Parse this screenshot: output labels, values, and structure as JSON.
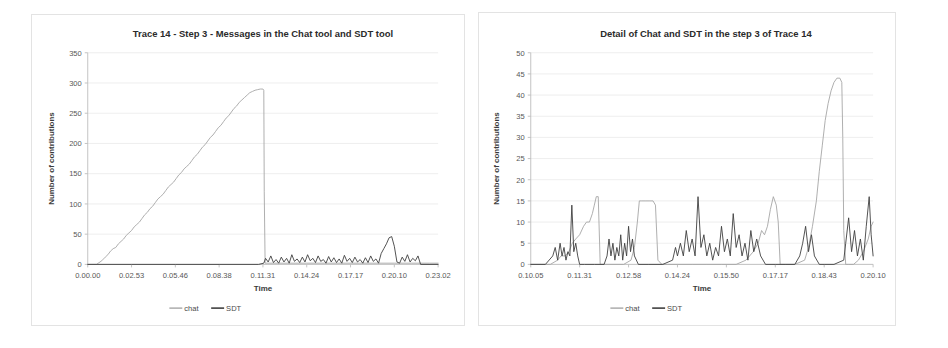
{
  "figure": {
    "background": "#ffffff",
    "panel_border_color": "#e3e3e3"
  },
  "colors": {
    "chat": "#a6a6a6",
    "sdt": "#3f3f3f",
    "grid": "#e9e9e9",
    "axis": "#bdbdbd",
    "text": "#404040"
  },
  "legend": {
    "chat_label": "chat",
    "sdt_label": "SDT"
  },
  "chart_data": [
    {
      "id": "left",
      "type": "line",
      "title": "Trace 14 - Step 3 - Messages in the Chat tool and SDT tool",
      "xlabel": "Time",
      "ylabel": "Number of contributions",
      "grid": true,
      "legend_position": "bottom",
      "ylim": [
        0,
        350
      ],
      "yticks": [
        0,
        50,
        100,
        150,
        200,
        250,
        300,
        350
      ],
      "ytick_labels": [
        "0",
        "50",
        "100",
        "150",
        "200",
        "250",
        "300",
        "350"
      ],
      "xlim": [
        0,
        8
      ],
      "xticks": [
        0,
        1,
        2,
        3,
        4,
        5,
        6,
        7,
        8
      ],
      "xtick_labels": [
        "0.00.00",
        "0.02.53",
        "0.05.46",
        "0.08.38",
        "0.11.31",
        "0.14.24",
        "0.17.17",
        "0.20.10",
        "0.23.02"
      ],
      "series": [
        {
          "name": "chat",
          "color": "#a6a6a6",
          "x": [
            0.0,
            0.2,
            0.32,
            0.4,
            0.46,
            0.52,
            0.58,
            0.64,
            0.7,
            0.76,
            0.82,
            0.88,
            0.94,
            1.0,
            1.06,
            1.12,
            1.18,
            1.24,
            1.3,
            1.36,
            1.42,
            1.48,
            1.54,
            1.6,
            1.66,
            1.72,
            1.78,
            1.84,
            1.9,
            1.96,
            2.02,
            2.08,
            2.14,
            2.2,
            2.26,
            2.32,
            2.38,
            2.44,
            2.5,
            2.56,
            2.62,
            2.68,
            2.74,
            2.8,
            2.86,
            2.92,
            2.98,
            3.04,
            3.1,
            3.16,
            3.22,
            3.28,
            3.34,
            3.4,
            3.46,
            3.52,
            3.58,
            3.64,
            3.7,
            3.76,
            3.82,
            3.88,
            3.94,
            4.0,
            4.02,
            4.03,
            4.05,
            4.3,
            4.6,
            5.0,
            5.4,
            5.8,
            6.2,
            6.6,
            7.0,
            7.4,
            7.8,
            8.0
          ],
          "y": [
            0,
            0,
            6,
            12,
            16,
            22,
            26,
            28,
            34,
            38,
            42,
            48,
            52,
            56,
            62,
            66,
            70,
            76,
            82,
            86,
            92,
            96,
            102,
            108,
            112,
            116,
            122,
            128,
            132,
            136,
            142,
            148,
            152,
            158,
            162,
            166,
            172,
            178,
            182,
            188,
            194,
            198,
            204,
            210,
            214,
            220,
            226,
            230,
            236,
            242,
            246,
            252,
            258,
            262,
            268,
            272,
            276,
            280,
            284,
            286,
            288,
            289,
            290,
            290,
            288,
            120,
            2,
            2,
            2,
            2,
            2,
            2,
            2,
            2,
            2,
            2,
            2,
            2
          ]
        },
        {
          "name": "SDT",
          "color": "#3f3f3f",
          "x": [
            0.0,
            1.0,
            2.0,
            3.0,
            3.9,
            4.02,
            4.06,
            4.12,
            4.18,
            4.24,
            4.3,
            4.36,
            4.42,
            4.48,
            4.54,
            4.6,
            4.66,
            4.72,
            4.78,
            4.84,
            4.9,
            4.96,
            5.02,
            5.08,
            5.14,
            5.2,
            5.26,
            5.32,
            5.38,
            5.44,
            5.5,
            5.56,
            5.62,
            5.68,
            5.74,
            5.8,
            5.86,
            5.92,
            5.98,
            6.04,
            6.1,
            6.16,
            6.22,
            6.28,
            6.34,
            6.4,
            6.46,
            6.52,
            6.58,
            6.64,
            6.7,
            6.76,
            6.82,
            6.88,
            6.94,
            7.0,
            7.06,
            7.12,
            7.18,
            7.24,
            7.3,
            7.36,
            7.42,
            7.48,
            7.54,
            7.6,
            8.0
          ],
          "y": [
            0,
            0,
            0,
            0,
            0,
            2,
            10,
            4,
            14,
            3,
            8,
            2,
            12,
            4,
            10,
            2,
            16,
            5,
            9,
            3,
            12,
            4,
            16,
            6,
            10,
            3,
            14,
            5,
            8,
            2,
            13,
            4,
            11,
            3,
            9,
            2,
            15,
            5,
            10,
            3,
            12,
            4,
            8,
            2,
            11,
            3,
            14,
            5,
            9,
            2,
            18,
            26,
            34,
            44,
            46,
            30,
            4,
            2,
            12,
            5,
            16,
            4,
            10,
            6,
            14,
            0,
            0
          ]
        }
      ]
    },
    {
      "id": "right",
      "type": "line",
      "title": "Detail of Chat and SDT in the step 3 of Trace 14",
      "xlabel": "Time",
      "ylabel": "Number of contributions",
      "grid": true,
      "legend_position": "bottom",
      "ylim": [
        0,
        50
      ],
      "yticks": [
        0,
        5,
        10,
        15,
        20,
        25,
        30,
        35,
        40,
        45,
        50
      ],
      "ytick_labels": [
        "0",
        "5",
        "10",
        "15",
        "20",
        "25",
        "30",
        "35",
        "40",
        "45",
        "50"
      ],
      "xlim": [
        0,
        7
      ],
      "xticks": [
        0,
        1,
        2,
        3,
        4,
        5,
        6,
        7
      ],
      "xtick_labels": [
        "0.10.05",
        "0.11.31",
        "0.12.58",
        "0.14.24",
        "0.15.50",
        "0.17.17",
        "0.18.43",
        "0.20.10"
      ],
      "series": [
        {
          "name": "chat",
          "color": "#a6a6a6",
          "x": [
            0.0,
            0.2,
            0.4,
            0.55,
            0.62,
            0.7,
            0.78,
            0.85,
            0.92,
            1.0,
            1.08,
            1.14,
            1.2,
            1.26,
            1.3,
            1.34,
            1.38,
            1.42,
            1.5,
            1.7,
            1.9,
            2.05,
            2.12,
            2.18,
            2.22,
            2.26,
            2.34,
            2.42,
            2.5,
            2.55,
            2.6,
            2.68,
            2.8,
            3.0,
            3.3,
            3.6,
            3.9,
            4.2,
            4.4,
            4.55,
            4.65,
            4.72,
            4.78,
            4.84,
            4.9,
            4.96,
            5.02,
            5.06,
            5.1,
            5.2,
            5.4,
            5.6,
            5.68,
            5.76,
            5.84,
            5.9,
            5.96,
            6.02,
            6.08,
            6.14,
            6.2,
            6.26,
            6.32,
            6.36,
            6.38,
            6.4,
            6.44,
            6.5,
            6.6,
            6.7,
            6.8,
            6.9,
            6.96,
            7.0
          ],
          "y": [
            0,
            0,
            0,
            1,
            2,
            2,
            3,
            5,
            6,
            7,
            9,
            10,
            10,
            12,
            14,
            16,
            16,
            0,
            0,
            0,
            0,
            1,
            4,
            10,
            15,
            15,
            15,
            15,
            15,
            14,
            1,
            0,
            0,
            0,
            0,
            0,
            0,
            0,
            1,
            3,
            5,
            8,
            7,
            9,
            13,
            16,
            14,
            10,
            0,
            0,
            0,
            1,
            4,
            9,
            15,
            22,
            28,
            34,
            38,
            41,
            43,
            44,
            44,
            43,
            30,
            8,
            0,
            0,
            0,
            1,
            3,
            6,
            9,
            10
          ]
        },
        {
          "name": "SDT",
          "color": "#3f3f3f",
          "x": [
            0.0,
            0.3,
            0.45,
            0.5,
            0.55,
            0.6,
            0.64,
            0.68,
            0.72,
            0.76,
            0.8,
            0.84,
            0.88,
            0.92,
            0.96,
            1.0,
            1.1,
            1.3,
            1.5,
            1.56,
            1.6,
            1.64,
            1.68,
            1.72,
            1.76,
            1.8,
            1.84,
            1.88,
            1.92,
            1.96,
            2.0,
            2.04,
            2.08,
            2.12,
            2.2,
            2.4,
            2.7,
            2.9,
            2.96,
            3.0,
            3.06,
            3.12,
            3.18,
            3.24,
            3.3,
            3.36,
            3.42,
            3.48,
            3.54,
            3.6,
            3.66,
            3.72,
            3.78,
            3.84,
            3.9,
            3.96,
            4.02,
            4.08,
            4.14,
            4.2,
            4.26,
            4.32,
            4.38,
            4.44,
            4.5,
            4.56,
            4.62,
            4.7,
            4.8,
            5.0,
            5.2,
            5.4,
            5.5,
            5.56,
            5.62,
            5.68,
            5.74,
            5.8,
            5.9,
            6.0,
            6.2,
            6.4,
            6.44,
            6.5,
            6.56,
            6.62,
            6.68,
            6.74,
            6.8,
            6.86,
            6.92,
            6.96,
            7.0
          ],
          "y": [
            0,
            0,
            2,
            4,
            1,
            5,
            2,
            4,
            1,
            3,
            2,
            14,
            3,
            5,
            2,
            0,
            0,
            0,
            0,
            2,
            6,
            2,
            5,
            1,
            4,
            2,
            7,
            1,
            5,
            2,
            9,
            3,
            6,
            2,
            0,
            0,
            0,
            1,
            4,
            2,
            5,
            2,
            8,
            3,
            6,
            2,
            16,
            4,
            7,
            2,
            5,
            1,
            4,
            2,
            9,
            3,
            6,
            2,
            12,
            4,
            7,
            2,
            5,
            1,
            8,
            3,
            6,
            2,
            0,
            0,
            0,
            0,
            2,
            5,
            9,
            3,
            7,
            2,
            0,
            0,
            0,
            1,
            5,
            11,
            3,
            8,
            2,
            6,
            1,
            9,
            16,
            7,
            2
          ]
        }
      ]
    }
  ]
}
